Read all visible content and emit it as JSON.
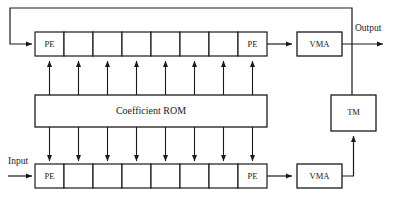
{
  "diagram": {
    "colors": {
      "stroke": "#1a1a1a",
      "fill": "#ffffff",
      "background": "#ffffff"
    },
    "io_labels": {
      "input": "Input",
      "output": "Output"
    },
    "top_row": {
      "name": "upper-pe-array",
      "cells": [
        {
          "label": "PE"
        },
        {
          "label": ""
        },
        {
          "label": ""
        },
        {
          "label": ""
        },
        {
          "label": ""
        },
        {
          "label": ""
        },
        {
          "label": ""
        },
        {
          "label": "PE"
        }
      ]
    },
    "bottom_row": {
      "name": "lower-pe-array",
      "cells": [
        {
          "label": "PE"
        },
        {
          "label": ""
        },
        {
          "label": ""
        },
        {
          "label": ""
        },
        {
          "label": ""
        },
        {
          "label": ""
        },
        {
          "label": ""
        },
        {
          "label": "PE"
        }
      ]
    },
    "rom": {
      "label": "Coefficient ROM"
    },
    "vma_top": {
      "label": "VMA"
    },
    "vma_bottom": {
      "label": "VMA"
    },
    "tm": {
      "label": "TM"
    },
    "connections": [
      {
        "name": "input-to-lower-pe",
        "from": "Input",
        "to": "lower-pe-array",
        "direction": "right"
      },
      {
        "name": "lower-array-to-lower-vma",
        "from": "lower-pe-array",
        "to": "VMA",
        "direction": "right"
      },
      {
        "name": "lower-vma-to-tm",
        "from": "VMA",
        "to": "TM",
        "direction": "up"
      },
      {
        "name": "tm-to-upper-feedback",
        "from": "TM",
        "to": "upper-pe-array",
        "direction": "up-left"
      },
      {
        "name": "upper-array-to-upper-vma",
        "from": "upper-pe-array",
        "to": "VMA",
        "direction": "right"
      },
      {
        "name": "upper-vma-to-output",
        "from": "VMA",
        "to": "Output",
        "direction": "right"
      },
      {
        "name": "rom-to-upper-array",
        "from": "Coefficient ROM",
        "to": "upper-pe-array",
        "direction": "up",
        "count": 8
      },
      {
        "name": "rom-to-lower-array",
        "from": "Coefficient ROM",
        "to": "lower-pe-array",
        "direction": "down",
        "count": 8
      }
    ]
  }
}
